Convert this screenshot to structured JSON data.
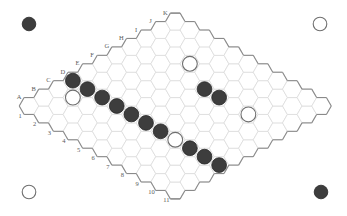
{
  "game": {
    "name": "Hex",
    "board_size": 11,
    "column_labels": [
      "A",
      "B",
      "C",
      "D",
      "E",
      "F",
      "G",
      "H",
      "I",
      "J",
      "K"
    ],
    "row_labels": [
      "1",
      "2",
      "3",
      "4",
      "5",
      "6",
      "7",
      "8",
      "9",
      "10",
      "11"
    ],
    "colors": {
      "background": "#ffffff",
      "grid_line": "#dcdcdc",
      "border": "#8a8a8a",
      "label": "#5a5a5a",
      "black_stone": "#3d3d3d",
      "white_stone": "#ffffff"
    },
    "corner_markers": [
      {
        "position": "top-left",
        "color": "black"
      },
      {
        "position": "top-right",
        "color": "white"
      },
      {
        "position": "bottom-left",
        "color": "white"
      },
      {
        "position": "bottom-right",
        "color": "black"
      }
    ],
    "stones": [
      {
        "cell": "D1",
        "color": "black"
      },
      {
        "cell": "D2",
        "color": "black"
      },
      {
        "cell": "D3",
        "color": "black"
      },
      {
        "cell": "D4",
        "color": "black"
      },
      {
        "cell": "D5",
        "color": "black"
      },
      {
        "cell": "D6",
        "color": "black"
      },
      {
        "cell": "D7",
        "color": "black"
      },
      {
        "cell": "D8",
        "color": "white"
      },
      {
        "cell": "D9",
        "color": "black"
      },
      {
        "cell": "D10",
        "color": "black"
      },
      {
        "cell": "D11",
        "color": "black"
      },
      {
        "cell": "C2",
        "color": "white"
      },
      {
        "cell": "I4",
        "color": "white"
      },
      {
        "cell": "H6",
        "color": "black"
      },
      {
        "cell": "H7",
        "color": "black"
      },
      {
        "cell": "H9",
        "color": "white"
      }
    ]
  }
}
